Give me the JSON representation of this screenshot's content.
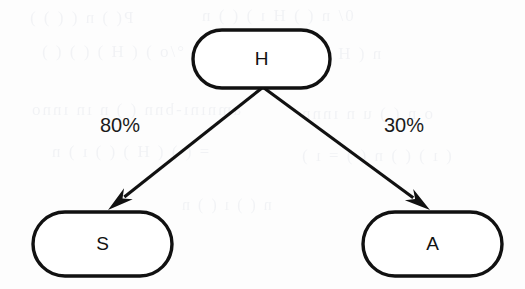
{
  "figure": {
    "type": "tree-diagram",
    "background_color": "#fdfdfd",
    "ink_color": "#111111",
    "canvas": {
      "width": 525,
      "height": 289
    }
  },
  "nodes": [
    {
      "id": "H",
      "label": "H",
      "role": "root",
      "shape": "stadium",
      "x": 193,
      "y": 30,
      "width": 137,
      "height": 58,
      "shadow_side": "bottom"
    },
    {
      "id": "S",
      "label": "S",
      "role": "leaf",
      "shape": "stadium",
      "x": 33,
      "y": 212,
      "width": 139,
      "height": 64,
      "shadow_side": "top"
    },
    {
      "id": "A",
      "label": "A",
      "role": "leaf",
      "shape": "stadium",
      "x": 363,
      "y": 212,
      "width": 139,
      "height": 64,
      "shadow_side": "top"
    }
  ],
  "edges": [
    {
      "id": "H-to-S",
      "from": "H",
      "to": "S",
      "label": "80%",
      "label_x": 120,
      "label_y": 127,
      "x1": 262,
      "y1": 88,
      "x2": 108,
      "y2": 210,
      "arrowhead": "solid-triangle"
    },
    {
      "id": "H-to-A",
      "from": "H",
      "to": "A",
      "label": "30%",
      "label_x": 404,
      "label_y": 127,
      "x1": 264,
      "y1": 88,
      "x2": 430,
      "y2": 210,
      "arrowhead": "solid-triangle"
    }
  ],
  "ghost_text": [
    {
      "text": "P( ) n  ( (  ) )",
      "x": 28,
      "y": 8,
      "size": 17
    },
    {
      "text": "0/  n ( ) H  ı ) ( ) n",
      "x": 200,
      "y": 6,
      "size": 17
    },
    {
      "text": "°/o   ) (   H ) ( ) ( )",
      "x": 40,
      "y": 42,
      "size": 17
    },
    {
      "text": "n  ( H ) ( ) n    ( )",
      "x": 250,
      "y": 44,
      "size": 17
    },
    {
      "text": "amnını-bnn ( )  n ın ınno",
      "x": 30,
      "y": 100,
      "size": 17
    },
    {
      "text": "o n ( )  u  n  ınnn",
      "x": 300,
      "y": 104,
      "size": 17
    },
    {
      "text": "=  ( )  ( H ) ( ) ı ) n",
      "x": 50,
      "y": 142,
      "size": 17
    },
    {
      "text": "( ı ) ( ) n ( ) = ı )",
      "x": 300,
      "y": 146,
      "size": 17
    },
    {
      "text": "n ( ) ı ( )  n",
      "x": 180,
      "y": 196,
      "size": 16
    },
    {
      "text": "( ) n  ın",
      "x": 380,
      "y": 252,
      "size": 16
    }
  ]
}
